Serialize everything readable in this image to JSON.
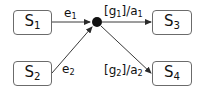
{
  "diagram": {
    "type": "statechart-junction",
    "states": [
      {
        "id": "S1",
        "base": "S",
        "sub": "1"
      },
      {
        "id": "S2",
        "base": "S",
        "sub": "2"
      },
      {
        "id": "S3",
        "base": "S",
        "sub": "3"
      },
      {
        "id": "S4",
        "base": "S",
        "sub": "4"
      }
    ],
    "junction": {
      "id": "junction",
      "kind": "filled-circle"
    },
    "edges": [
      {
        "from": "S1",
        "to": "junction",
        "label": {
          "base": "e",
          "sub": "1",
          "pre": "",
          "post": ""
        }
      },
      {
        "from": "S2",
        "to": "junction",
        "label": {
          "base": "e",
          "sub": "2",
          "pre": "",
          "post": ""
        }
      },
      {
        "from": "junction",
        "to": "S3",
        "label": {
          "pre": "[g",
          "sub": "1",
          "mid": "]/a",
          "sub2": "1"
        }
      },
      {
        "from": "junction",
        "to": "S4",
        "label": {
          "pre": "[g",
          "sub": "2",
          "mid": "]/a",
          "sub2": "2"
        }
      }
    ],
    "colors": {
      "line": "#3a3a3a",
      "box_border": "#6b6b6b",
      "text": "#111111",
      "background": "#ffffff"
    }
  }
}
